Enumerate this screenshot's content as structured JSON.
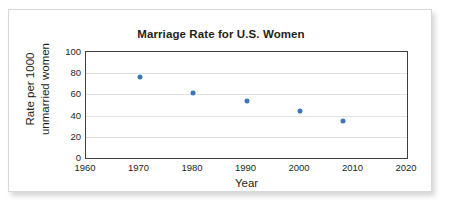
{
  "figure": {
    "title": "Marriage Rate for U.S. Women",
    "xlabel": "Year",
    "ylabel_line1": "Rate per 1000",
    "ylabel_line2": "unmarried women",
    "marker_color": "#3b77b5",
    "axis_color": "#3f3f3f",
    "grid_color": "#e3e3e3",
    "frame_border_color": "#d8d8d8"
  },
  "chart_data": {
    "type": "scatter",
    "title": "Marriage Rate for U.S. Women",
    "xlabel": "Year",
    "ylabel": "Rate per 1000 unmarried women",
    "x": [
      1970,
      1980,
      1990,
      2000,
      2008
    ],
    "values": [
      76,
      61,
      54,
      44,
      35
    ],
    "points": [
      {
        "x": 1970,
        "y": 76
      },
      {
        "x": 1980,
        "y": 61
      },
      {
        "x": 1990,
        "y": 54
      },
      {
        "x": 2000,
        "y": 44
      },
      {
        "x": 2008,
        "y": 35
      }
    ],
    "xlim": [
      1960,
      2020
    ],
    "ylim": [
      0,
      100
    ],
    "xticks": [
      1960,
      1970,
      1980,
      1990,
      2000,
      2010,
      2020
    ],
    "yticks": [
      0,
      20,
      40,
      60,
      80,
      100
    ],
    "xtick_labels": [
      "1960",
      "1970",
      "1980",
      "1990",
      "2000",
      "2010",
      "2020"
    ],
    "ytick_labels": [
      "0",
      "20",
      "40",
      "60",
      "80",
      "100"
    ],
    "grid": true,
    "grid_axis": "y",
    "legend": null,
    "marker_color": "#3b77b5"
  }
}
